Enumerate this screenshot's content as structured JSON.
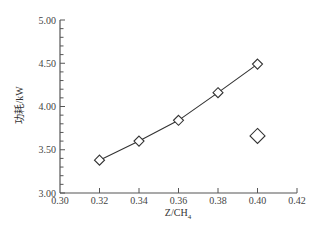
{
  "chart_data": {
    "type": "line",
    "title": "",
    "xlabel": "Z/CH4",
    "xlabel_main": "Z/CH",
    "xlabel_sub": "4",
    "ylabel": "功耗/kW",
    "xlim": [
      0.3,
      0.42
    ],
    "ylim": [
      3.0,
      5.0
    ],
    "x_ticks": [
      "0.30",
      "0.32",
      "0.34",
      "0.36",
      "0.38",
      "0.40",
      "0.42"
    ],
    "y_ticks": [
      "3.00",
      "3.50",
      "4.00",
      "4.50",
      "5.00"
    ],
    "y_minor_step": 0.1,
    "grid": false,
    "legend": null,
    "series": [
      {
        "name": "power consumption",
        "marker": "diamond-open",
        "line": "solid",
        "x": [
          0.32,
          0.34,
          0.36,
          0.38,
          0.4
        ],
        "values": [
          3.38,
          3.6,
          3.84,
          4.16,
          4.49
        ]
      },
      {
        "name": "single point",
        "marker": "diamond-open-large",
        "line": "none",
        "x": [
          0.4
        ],
        "values": [
          3.66
        ]
      }
    ]
  },
  "colors": {
    "axis": "#555555",
    "line": "#333333",
    "marker_fill": "#ffffff"
  }
}
